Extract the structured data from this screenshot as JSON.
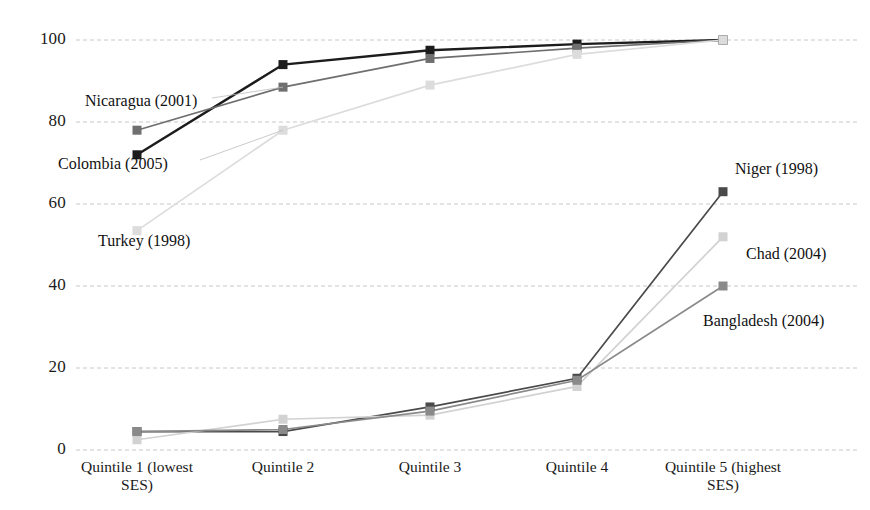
{
  "chart_data": {
    "type": "line",
    "title": "",
    "xlabel": "",
    "ylabel": "",
    "ylim": [
      0,
      100
    ],
    "yticks": [
      0,
      20,
      40,
      60,
      80,
      100
    ],
    "grid": true,
    "legend_position": "inline-annotations",
    "categories": [
      "Quintile 1 (lowest SES)",
      "Quintile 2",
      "Quintile 3",
      "Quintile 4",
      "Quintile 5 (highest SES)"
    ],
    "category_lines": [
      [
        "Quintile 1 (lowest",
        "SES)"
      ],
      [
        "Quintile 2"
      ],
      [
        "Quintile 3"
      ],
      [
        "Quintile 4"
      ],
      [
        "Quintile 5 (highest",
        "SES)"
      ]
    ],
    "series": [
      {
        "name": "Colombia (2005)",
        "color": "#1c1c1c",
        "values": [
          72,
          94,
          97.5,
          99,
          100
        ]
      },
      {
        "name": "Nicaragua (2001)",
        "color": "#6f6f6f",
        "values": [
          78,
          88.5,
          95.5,
          98,
          100
        ]
      },
      {
        "name": "Turkey (1998)",
        "color": "#dcdcdc",
        "values": [
          53.5,
          78,
          89,
          96.5,
          100
        ]
      },
      {
        "name": "Niger (1998)",
        "color": "#4a4a4a",
        "values": [
          4.5,
          4.5,
          10.5,
          17.5,
          63
        ]
      },
      {
        "name": "Chad (2004)",
        "color": "#d2d2d2",
        "values": [
          2.5,
          7.5,
          8.5,
          15.5,
          52
        ]
      },
      {
        "name": "Bangladesh (2004)",
        "color": "#8a8a8a",
        "values": [
          4.5,
          5,
          9.5,
          17,
          40
        ]
      }
    ],
    "annotations": [
      {
        "text": "Nicaragua (2001)",
        "x": 85,
        "y": 92,
        "anchor": "left"
      },
      {
        "text": "Colombia (2005)",
        "x": 58,
        "y": 155,
        "anchor": "left"
      },
      {
        "text": "Turkey (1998)",
        "x": 98,
        "y": 232,
        "anchor": "left"
      },
      {
        "text": "Niger (1998)",
        "x": 735,
        "y": 160,
        "anchor": "left"
      },
      {
        "text": "Chad (2004)",
        "x": 746,
        "y": 245,
        "anchor": "left"
      },
      {
        "text": "Bangladesh (2004)",
        "x": 703,
        "y": 312,
        "anchor": "left"
      }
    ],
    "ytick_labels": [
      "100",
      "80",
      "60",
      "40",
      "20",
      "0"
    ],
    "gridline_color": "#c8c8c8",
    "axis_color": "#c8c8c8"
  },
  "geometry": {
    "plot_left": 76,
    "plot_right": 860,
    "y_top_px": 40,
    "y_bottom_px": 450,
    "x_positions": [
      137,
      283,
      430,
      577,
      723
    ],
    "gridline_y": [
      40,
      122,
      205,
      287,
      368,
      450
    ],
    "marker_size": 9
  }
}
